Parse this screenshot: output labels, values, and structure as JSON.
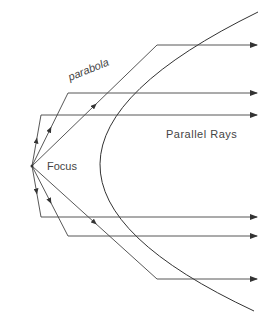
{
  "diagram": {
    "labels": {
      "parabola": "parabola",
      "parallel_rays": "Parallel Rays",
      "focus": "Focus"
    },
    "colors": {
      "line": "#444444",
      "background": "#ffffff"
    },
    "focus_point": [
      32,
      166
    ],
    "reflection_points": [
      {
        "x": 157,
        "y": 45
      },
      {
        "x": 68,
        "y": 93
      },
      {
        "x": 41,
        "y": 115
      },
      {
        "x": 41,
        "y": 217
      },
      {
        "x": 68,
        "y": 236
      },
      {
        "x": 157,
        "y": 279
      }
    ],
    "ray_end_x": 257
  }
}
